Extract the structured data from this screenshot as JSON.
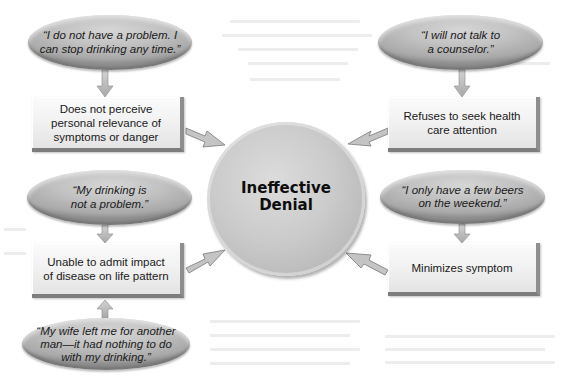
{
  "diagram": {
    "center": {
      "label": "Ineffective\nDenial"
    },
    "branches": [
      {
        "position": "top-left",
        "quote": "“I do not have a problem. I\ncan stop drinking any time.”",
        "behavior": "Does not perceive\npersonal relevance of\nsymptoms or danger"
      },
      {
        "position": "top-right",
        "quote": "“I will not talk to\na counselor.”",
        "behavior": "Refuses to seek health\ncare attention"
      },
      {
        "position": "bottom-left",
        "quote": "“My drinking is\nnot a problem.”",
        "extra_quote": "“My wife left me for another\nman—it had nothing to do\nwith my drinking.”",
        "behavior": "Unable to admit impact\nof disease on life pattern"
      },
      {
        "position": "bottom-right",
        "quote": "“I only have a few beers\non the weekend.”",
        "behavior": "Minimizes symptom"
      }
    ],
    "colors": {
      "ellipse_fill": "#c2c2c2",
      "box_fill": "#f1f1f1",
      "box_shadow": "#8e8e8e",
      "circle_fill": "#cbcbcb",
      "arrow_fill": "#bdbdbd",
      "text": "#1a1a1a"
    }
  }
}
